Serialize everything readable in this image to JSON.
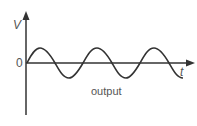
{
  "diagram": {
    "y_axis_label": "V",
    "x_axis_label": "t",
    "origin_label": "0",
    "caption": "output",
    "waveform": "sine",
    "line_color": "#333333",
    "text_color": "#555555"
  }
}
